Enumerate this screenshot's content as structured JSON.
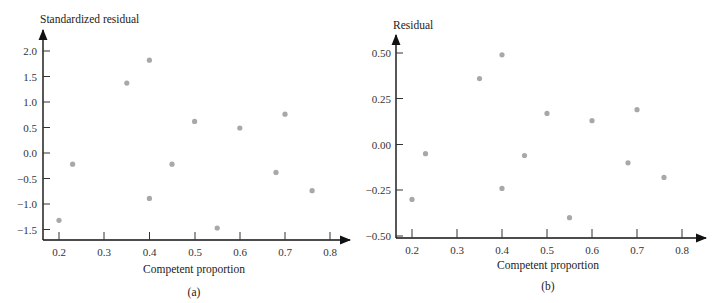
{
  "chart_data": [
    {
      "type": "scatter",
      "panel": "(a)",
      "title": "",
      "xlabel": "Competent proportion",
      "ylabel": "Standardized residual",
      "xlim": [
        0.17,
        0.84
      ],
      "ylim": [
        -1.7,
        2.3
      ],
      "xticks": [
        "0.2",
        "0.3",
        "0.4",
        "0.5",
        "0.6",
        "0.7",
        "0.8"
      ],
      "yticks": [
        "2.0",
        "1.5",
        "1.0",
        "0.5",
        "0.0",
        "−0.5",
        "−1.0",
        "−1.5"
      ],
      "grid": false,
      "point_color": "#a8a8a8",
      "points": [
        {
          "x": 0.2,
          "y": -1.32
        },
        {
          "x": 0.23,
          "y": -0.22
        },
        {
          "x": 0.35,
          "y": 1.37
        },
        {
          "x": 0.4,
          "y": 1.82
        },
        {
          "x": 0.4,
          "y": -0.89
        },
        {
          "x": 0.45,
          "y": -0.22
        },
        {
          "x": 0.5,
          "y": 0.62
        },
        {
          "x": 0.55,
          "y": -1.47
        },
        {
          "x": 0.6,
          "y": 0.49
        },
        {
          "x": 0.68,
          "y": -0.38
        },
        {
          "x": 0.7,
          "y": 0.76
        },
        {
          "x": 0.76,
          "y": -0.74
        }
      ]
    },
    {
      "type": "scatter",
      "panel": "(b)",
      "title": "",
      "xlabel": "Competent proportion",
      "ylabel": "Residual",
      "xlim": [
        0.17,
        0.84
      ],
      "ylim": [
        -0.51,
        0.6
      ],
      "xticks": [
        "0.2",
        "0.3",
        "0.4",
        "0.5",
        "0.6",
        "0.7",
        "0.8"
      ],
      "yticks": [
        "0.50",
        "0.25",
        "0.00",
        "−0.25",
        "−0.50"
      ],
      "grid": false,
      "point_color": "#a8a8a8",
      "points": [
        {
          "x": 0.2,
          "y": -0.3
        },
        {
          "x": 0.23,
          "y": -0.05
        },
        {
          "x": 0.35,
          "y": 0.36
        },
        {
          "x": 0.4,
          "y": 0.49
        },
        {
          "x": 0.4,
          "y": -0.24
        },
        {
          "x": 0.45,
          "y": -0.06
        },
        {
          "x": 0.5,
          "y": 0.17
        },
        {
          "x": 0.55,
          "y": -0.4
        },
        {
          "x": 0.6,
          "y": 0.13
        },
        {
          "x": 0.68,
          "y": -0.1
        },
        {
          "x": 0.7,
          "y": 0.19
        },
        {
          "x": 0.76,
          "y": -0.18
        }
      ]
    }
  ],
  "panels": {
    "a": {
      "ylabel": "Standardized residual",
      "xlabel": "Competent proportion",
      "caption": "(a)",
      "yticks": [
        "2.0",
        "1.5",
        "1.0",
        "0.5",
        "0.0",
        "−0.5",
        "−1.0",
        "−1.5"
      ],
      "xticks": [
        "0.2",
        "0.3",
        "0.4",
        "0.5",
        "0.6",
        "0.7",
        "0.8"
      ]
    },
    "b": {
      "ylabel": "Residual",
      "xlabel": "Competent proportion",
      "caption": "(b)",
      "yticks": [
        "0.50",
        "0.25",
        "0.00",
        "−0.25",
        "−0.50"
      ],
      "xticks": [
        "0.2",
        "0.3",
        "0.4",
        "0.5",
        "0.6",
        "0.7",
        "0.8"
      ]
    }
  }
}
